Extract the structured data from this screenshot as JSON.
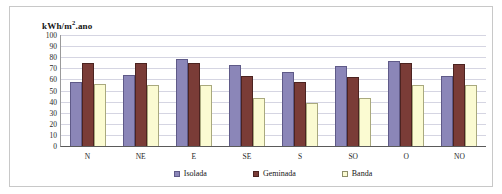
{
  "chart_data": {
    "type": "bar",
    "title_prefix": "kWh/m",
    "title_sup": "2",
    "title_suffix": ".ano",
    "xlabel": "",
    "ylabel": "",
    "ylim": [
      0,
      100
    ],
    "ytick_step": 10,
    "yticks": [
      100,
      90,
      80,
      70,
      60,
      50,
      40,
      30,
      20,
      10,
      0
    ],
    "grid": true,
    "legend_position": "bottom",
    "categories": [
      "N",
      "NE",
      "E",
      "SE",
      "S",
      "SO",
      "O",
      "NO"
    ],
    "series": [
      {
        "name": "Isolada",
        "color": "#8b86b8",
        "values": [
          58,
          64,
          78,
          73,
          67,
          72,
          77,
          63
        ]
      },
      {
        "name": "Geminada",
        "color": "#7a3c37",
        "values": [
          75,
          75,
          75,
          63,
          58,
          62,
          75,
          74
        ]
      },
      {
        "name": "Banda",
        "color": "#fbfbd2",
        "values": [
          56,
          55,
          55,
          43,
          39,
          43,
          55,
          55
        ]
      }
    ]
  }
}
